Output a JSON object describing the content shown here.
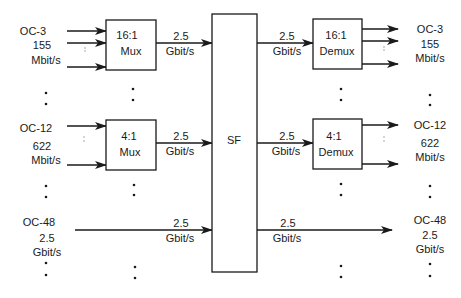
{
  "diagram": {
    "title": "",
    "colors": {
      "stroke": "#1a1a1a",
      "background": "#ffffff"
    },
    "switch_fabric": {
      "label": "SF",
      "x": 212,
      "y": 14,
      "w": 45,
      "h": 258
    },
    "left_labels": [
      {
        "name": "oc3-in",
        "lines": [
          "OC-3",
          "155",
          "Mbit/s"
        ]
      },
      {
        "name": "oc12-in",
        "lines": [
          "OC-12",
          "622",
          "Mbit/s"
        ]
      },
      {
        "name": "oc48-in",
        "lines": [
          "OC-48",
          "2.5",
          "Gbit/s"
        ]
      }
    ],
    "right_labels": [
      {
        "name": "oc3-out",
        "lines": [
          "OC-3",
          "155",
          "Mbit/s"
        ]
      },
      {
        "name": "oc12-out",
        "lines": [
          "OC-12",
          "622",
          "Mbit/s"
        ]
      },
      {
        "name": "oc48-out",
        "lines": [
          "OC-48",
          "2.5",
          "Gbit/s"
        ]
      }
    ],
    "mux_boxes": [
      {
        "name": "mux-16-1",
        "ratio": "16:1",
        "type": "Mux"
      },
      {
        "name": "mux-4-1",
        "ratio": "4:1",
        "type": "Mux"
      }
    ],
    "demux_boxes": [
      {
        "name": "demux-16-1",
        "ratio": "16:1",
        "type": "Demux"
      },
      {
        "name": "demux-4-1",
        "ratio": "4:1",
        "type": "Demux"
      }
    ],
    "link_rates": [
      {
        "name": "mux16-to-sf",
        "rate": "2.5",
        "unit": "Gbit/s"
      },
      {
        "name": "mux4-to-sf",
        "rate": "2.5",
        "unit": "Gbit/s"
      },
      {
        "name": "oc48-to-sf",
        "rate": "2.5",
        "unit": "Gbit/s"
      },
      {
        "name": "sf-to-demux16",
        "rate": "2.5",
        "unit": "Gbit/s"
      },
      {
        "name": "sf-to-demux4",
        "rate": "2.5",
        "unit": "Gbit/s"
      },
      {
        "name": "sf-to-oc48",
        "rate": "2.5",
        "unit": "Gbit/s"
      }
    ],
    "ellipsis": ":"
  }
}
